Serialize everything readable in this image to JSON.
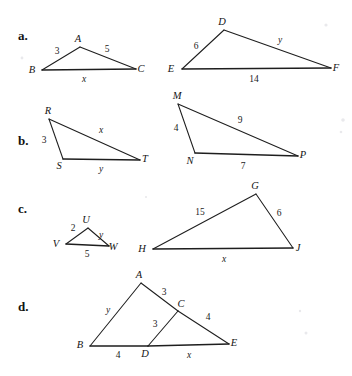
{
  "page": {
    "width": 352,
    "height": 376,
    "background": "#ffffff",
    "ink": "#1e1e1e"
  },
  "rows": [
    {
      "id": "a",
      "label": "a.",
      "label_pos": {
        "x": 18,
        "y": 40
      },
      "figures": [
        {
          "id": "abc",
          "name": "triangle-abc",
          "vertices": [
            {
              "name": "A",
              "x": 80,
              "y": 47,
              "label_dx": -2,
              "label_dy": -5
            },
            {
              "name": "B",
              "x": 42,
              "y": 70,
              "label_dx": -10,
              "label_dy": 3
            },
            {
              "name": "C",
              "x": 136,
              "y": 69,
              "label_dx": 5,
              "label_dy": 3
            }
          ],
          "edges": [
            {
              "from": 1,
              "to": 0,
              "label": "3",
              "numeric": true,
              "lx": 57,
              "ly": 54
            },
            {
              "from": 0,
              "to": 2,
              "label": "5",
              "numeric": true,
              "lx": 107,
              "ly": 52
            },
            {
              "from": 1,
              "to": 2,
              "label": "x",
              "numeric": false,
              "lx": 84,
              "ly": 82,
              "base": true
            }
          ]
        },
        {
          "id": "def",
          "name": "triangle-def",
          "vertices": [
            {
              "name": "D",
              "x": 224,
              "y": 30,
              "label_dx": -2,
              "label_dy": -5
            },
            {
              "name": "E",
              "x": 182,
              "y": 69,
              "label_dx": -11,
              "label_dy": 3
            },
            {
              "name": "F",
              "x": 331,
              "y": 68,
              "label_dx": 5,
              "label_dy": 3
            }
          ],
          "edges": [
            {
              "from": 1,
              "to": 0,
              "label": "6",
              "numeric": true,
              "lx": 196,
              "ly": 49
            },
            {
              "from": 0,
              "to": 2,
              "label": "y",
              "numeric": false,
              "lx": 280,
              "ly": 43
            },
            {
              "from": 1,
              "to": 2,
              "label": "14",
              "numeric": true,
              "lx": 254,
              "ly": 82,
              "base": true
            }
          ]
        }
      ]
    },
    {
      "id": "b",
      "label": "b.",
      "label_pos": {
        "x": 18,
        "y": 145
      },
      "figures": [
        {
          "id": "rst",
          "name": "triangle-rst",
          "vertices": [
            {
              "name": "R",
              "x": 49,
              "y": 119,
              "label_dx": -1,
              "label_dy": -5
            },
            {
              "name": "S",
              "x": 63,
              "y": 159,
              "label_dx": -4,
              "label_dy": 10
            },
            {
              "name": "T",
              "x": 140,
              "y": 160,
              "label_dx": 5,
              "label_dy": 2
            }
          ],
          "edges": [
            {
              "from": 0,
              "to": 1,
              "label": "3",
              "numeric": true,
              "lx": 44,
              "ly": 143
            },
            {
              "from": 0,
              "to": 2,
              "label": "x",
              "numeric": false,
              "lx": 101,
              "ly": 133
            },
            {
              "from": 1,
              "to": 2,
              "label": "y",
              "numeric": false,
              "lx": 101,
              "ly": 172,
              "base": true
            }
          ]
        },
        {
          "id": "mnp",
          "name": "triangle-mnp",
          "vertices": [
            {
              "name": "M",
              "x": 178,
              "y": 104,
              "label_dx": -1,
              "label_dy": -5
            },
            {
              "name": "N",
              "x": 195,
              "y": 153,
              "label_dx": -5,
              "label_dy": 11
            },
            {
              "name": "P",
              "x": 298,
              "y": 156,
              "label_dx": 5,
              "label_dy": 2
            }
          ],
          "edges": [
            {
              "from": 0,
              "to": 1,
              "label": "4",
              "numeric": true,
              "lx": 176,
              "ly": 131
            },
            {
              "from": 0,
              "to": 2,
              "label": "9",
              "numeric": true,
              "lx": 240,
              "ly": 123
            },
            {
              "from": 1,
              "to": 2,
              "label": "7",
              "numeric": true,
              "lx": 243,
              "ly": 169,
              "base": true
            }
          ]
        }
      ]
    },
    {
      "id": "c",
      "label": "c.",
      "label_pos": {
        "x": 18,
        "y": 213
      },
      "figures": [
        {
          "id": "uvw",
          "name": "triangle-uvw",
          "vertices": [
            {
              "name": "U",
              "x": 88,
              "y": 228,
              "label_dx": -2,
              "label_dy": -5
            },
            {
              "name": "V",
              "x": 66,
              "y": 244,
              "label_dx": -10,
              "label_dy": 3
            },
            {
              "name": "W",
              "x": 109,
              "y": 246,
              "label_dx": 4,
              "label_dy": 4
            }
          ],
          "edges": [
            {
              "from": 1,
              "to": 0,
              "label": "2",
              "numeric": true,
              "lx": 73,
              "ly": 231
            },
            {
              "from": 0,
              "to": 2,
              "label": "y",
              "numeric": false,
              "lx": 101,
              "ly": 238
            },
            {
              "from": 1,
              "to": 2,
              "label": "5",
              "numeric": true,
              "lx": 87,
              "ly": 257,
              "base": true
            }
          ]
        },
        {
          "id": "ghj",
          "name": "triangle-ghj",
          "vertices": [
            {
              "name": "G",
              "x": 256,
              "y": 194,
              "label_dx": -1,
              "label_dy": -5
            },
            {
              "name": "H",
              "x": 153,
              "y": 249,
              "label_dx": -11,
              "label_dy": 3
            },
            {
              "name": "J",
              "x": 293,
              "y": 248,
              "label_dx": 5,
              "label_dy": 3
            }
          ],
          "edges": [
            {
              "from": 1,
              "to": 0,
              "label": "15",
              "numeric": true,
              "lx": 200,
              "ly": 215
            },
            {
              "from": 0,
              "to": 2,
              "label": "6",
              "numeric": true,
              "lx": 279,
              "ly": 216
            },
            {
              "from": 1,
              "to": 2,
              "label": "x",
              "numeric": false,
              "lx": 224,
              "ly": 262,
              "base": true
            }
          ]
        }
      ]
    },
    {
      "id": "d",
      "label": "d.",
      "label_pos": {
        "x": 18,
        "y": 311
      },
      "figures": [
        {
          "id": "abcde",
          "name": "figure-abcde",
          "vertices": [
            {
              "name": "A",
              "x": 141,
              "y": 283,
              "label_dx": -2,
              "label_dy": -5
            },
            {
              "name": "B",
              "x": 90,
              "y": 346,
              "label_dx": -10,
              "label_dy": 2
            },
            {
              "name": "C",
              "x": 178,
              "y": 311,
              "label_dx": 3,
              "label_dy": -4
            },
            {
              "name": "D",
              "x": 148,
              "y": 346,
              "label_dx": -3,
              "label_dy": 11
            },
            {
              "name": "E",
              "x": 229,
              "y": 344,
              "label_dx": 5,
              "label_dy": 2
            }
          ],
          "edges": [
            {
              "from": 0,
              "to": 1,
              "label": "y",
              "numeric": false,
              "lx": 108,
              "ly": 313
            },
            {
              "from": 0,
              "to": 2,
              "label": "3",
              "numeric": true,
              "lx": 164,
              "ly": 295
            },
            {
              "from": 2,
              "to": 4,
              "label": "4",
              "numeric": true,
              "lx": 208,
              "ly": 320
            },
            {
              "from": 2,
              "to": 3,
              "label": "3",
              "numeric": true,
              "lx": 155,
              "ly": 327
            },
            {
              "from": 1,
              "to": 3,
              "label": "4",
              "numeric": true,
              "lx": 118,
              "ly": 358,
              "base": true
            },
            {
              "from": 3,
              "to": 4,
              "label": "x",
              "numeric": false,
              "lx": 189,
              "ly": 358,
              "base": true
            }
          ]
        }
      ]
    }
  ],
  "specks": [
    {
      "x": 22,
      "y": 58,
      "r": 1.4
    },
    {
      "x": 326,
      "y": 25,
      "r": 1.6
    },
    {
      "x": 343,
      "y": 120,
      "r": 1.8
    },
    {
      "x": 341,
      "y": 132,
      "r": 1.3
    },
    {
      "x": 306,
      "y": 333,
      "r": 1.5
    },
    {
      "x": 300,
      "y": 311,
      "r": 1.2
    },
    {
      "x": 146,
      "y": 197,
      "r": 1.1
    }
  ]
}
